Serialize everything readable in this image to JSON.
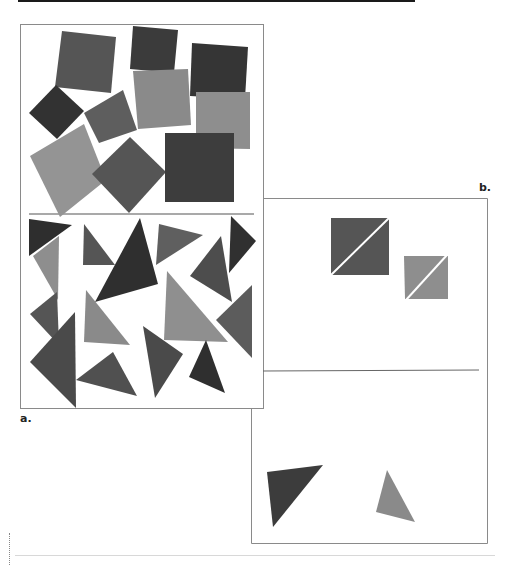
{
  "figure": {
    "panel_a": {
      "label": "a.",
      "top_section": "squares",
      "bottom_section": "triangles"
    },
    "panel_b": {
      "label": "b.",
      "top_section": "two squares split diagonally",
      "bottom_section": "two triangles"
    }
  },
  "colors": {
    "dark": "#3a3a3a",
    "mid_dark": "#4a4a4a",
    "mid": "#5a5a5a",
    "light": "#8c8c8c",
    "lighter": "#9a9a9a",
    "frame": "#777777"
  }
}
